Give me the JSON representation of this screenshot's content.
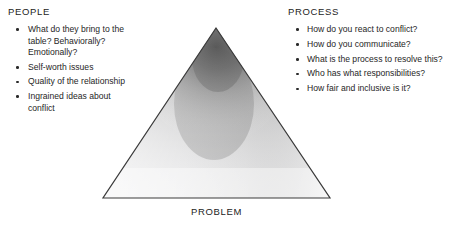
{
  "diagram": {
    "title_visible": false,
    "shape": {
      "name": "triangle",
      "apex": {
        "x": 216,
        "y": 28
      },
      "base_left": {
        "x": 103,
        "y": 198
      },
      "base_right": {
        "x": 330,
        "y": 198
      },
      "outline_color": "#3a3a3a",
      "fill_light": "#f2f2f2",
      "fill_dark": "#5a5a5a",
      "shading": "smoky gradient darkest just below apex, fading to light gray at base"
    },
    "bottom_label": "PROBLEM"
  },
  "people": {
    "heading": "PEOPLE",
    "bullets": [
      "What do they bring to the table? Behaviorally? Emotionally?",
      "Self-worth issues",
      "Quality of the relationship",
      "Ingrained ideas about conflict"
    ]
  },
  "process": {
    "heading": "PROCESS",
    "bullets": [
      "How do you react to conflict?",
      "How do you communicate?",
      "What is the process to resolve this?",
      "Who has what responsibilities?",
      "How fair and inclusive is it?"
    ]
  },
  "colors": {
    "background": "#ffffff",
    "text": "#262626",
    "outline": "#3a3a3a"
  }
}
